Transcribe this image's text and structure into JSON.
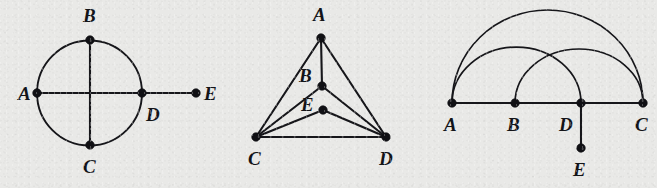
{
  "figure": {
    "background_color": "#e9e9e7",
    "ink_color": "#16161a",
    "panel_count": 3
  },
  "panels": [
    {
      "id": "panel-circle",
      "name": "circle-graph",
      "shape": "circle-with-diameters-and-pendant",
      "circle": {
        "cx": 89.5,
        "cy": 93,
        "r": 52.5
      },
      "nodes": [
        {
          "label": "A",
          "x": 37,
          "y": 93,
          "label_x": 18,
          "label_y": 100
        },
        {
          "label": "B",
          "x": 90,
          "y": 40,
          "label_x": 83,
          "label_y": 22
        },
        {
          "label": "C",
          "x": 90,
          "y": 145,
          "label_x": 83,
          "label_y": 173
        },
        {
          "label": "D",
          "x": 142,
          "y": 93,
          "label_x": 146,
          "label_y": 121
        },
        {
          "label": "E",
          "x": 196,
          "y": 93,
          "label_x": 204,
          "label_y": 100
        }
      ],
      "edges": [
        {
          "from": "A",
          "to": "D",
          "type": "line"
        },
        {
          "from": "D",
          "to": "E",
          "type": "line"
        },
        {
          "from": "B",
          "to": "C",
          "type": "line"
        }
      ]
    },
    {
      "id": "panel-triangle",
      "name": "triangle-graph",
      "shape": "triangle-with-interior-vertices",
      "nodes": [
        {
          "label": "A",
          "x": 321,
          "y": 38,
          "label_x": 313,
          "label_y": 21
        },
        {
          "label": "B",
          "x": 322,
          "y": 86,
          "label_x": 299,
          "label_y": 82
        },
        {
          "label": "C",
          "x": 256,
          "y": 137,
          "label_x": 248,
          "label_y": 165
        },
        {
          "label": "D",
          "x": 386,
          "y": 137,
          "label_x": 379,
          "label_y": 165
        },
        {
          "label": "E",
          "x": 323,
          "y": 110,
          "label_x": 301,
          "label_y": 111
        }
      ],
      "edges": [
        {
          "from": "A",
          "to": "C",
          "type": "line"
        },
        {
          "from": "A",
          "to": "D",
          "type": "line"
        },
        {
          "from": "A",
          "to": "B",
          "type": "line"
        },
        {
          "from": "B",
          "to": "C",
          "type": "line"
        },
        {
          "from": "B",
          "to": "D",
          "type": "line"
        },
        {
          "from": "C",
          "to": "D",
          "type": "line"
        },
        {
          "from": "E",
          "to": "C",
          "type": "line"
        },
        {
          "from": "E",
          "to": "D",
          "type": "line"
        }
      ]
    },
    {
      "id": "panel-arcs",
      "name": "arc-graph",
      "shape": "collinear-points-with-arcs-and-pendant",
      "nodes": [
        {
          "label": "A",
          "x": 452,
          "y": 103,
          "label_x": 444,
          "label_y": 131
        },
        {
          "label": "B",
          "x": 515,
          "y": 103,
          "label_x": 507,
          "label_y": 131
        },
        {
          "label": "D",
          "x": 581,
          "y": 103,
          "label_x": 559,
          "label_y": 131
        },
        {
          "label": "C",
          "x": 643,
          "y": 103,
          "label_x": 635,
          "label_y": 131
        },
        {
          "label": "E",
          "x": 581,
          "y": 148,
          "label_x": 573,
          "label_y": 176
        }
      ],
      "edges": [
        {
          "from": "A",
          "to": "C",
          "type": "line"
        },
        {
          "from": "D",
          "to": "E",
          "type": "line"
        }
      ],
      "arcs": [
        {
          "from": "A",
          "to": "C",
          "rise": 93
        },
        {
          "from": "A",
          "to": "D",
          "rise": 56
        },
        {
          "from": "B",
          "to": "C",
          "rise": 54
        }
      ]
    }
  ],
  "vertex_labels": [
    "A",
    "B",
    "C",
    "D",
    "E"
  ]
}
